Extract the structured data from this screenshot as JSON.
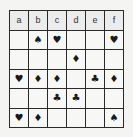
{
  "board": {
    "columns": [
      "a",
      "b",
      "c",
      "d",
      "e",
      "f"
    ],
    "rows": [
      [
        "",
        "♠",
        "♥",
        "",
        "",
        "♥"
      ],
      [
        "",
        "",
        "",
        "♦",
        "",
        ""
      ],
      [
        "♥",
        "♦",
        "♦",
        "",
        "♣",
        "♦"
      ],
      [
        "",
        "",
        "♣",
        "♣",
        "",
        ""
      ],
      [
        "♥",
        "♦",
        "",
        "",
        "",
        "♠"
      ]
    ],
    "row_suit_names": [
      [
        "empty",
        "spade",
        "heart",
        "empty",
        "empty",
        "heart"
      ],
      [
        "empty",
        "empty",
        "empty",
        "diamond",
        "empty",
        "empty"
      ],
      [
        "heart",
        "diamond",
        "diamond",
        "empty",
        "club",
        "diamond"
      ],
      [
        "empty",
        "empty",
        "club",
        "club",
        "empty",
        "empty"
      ],
      [
        "heart",
        "diamond",
        "empty",
        "empty",
        "empty",
        "spade"
      ]
    ]
  }
}
